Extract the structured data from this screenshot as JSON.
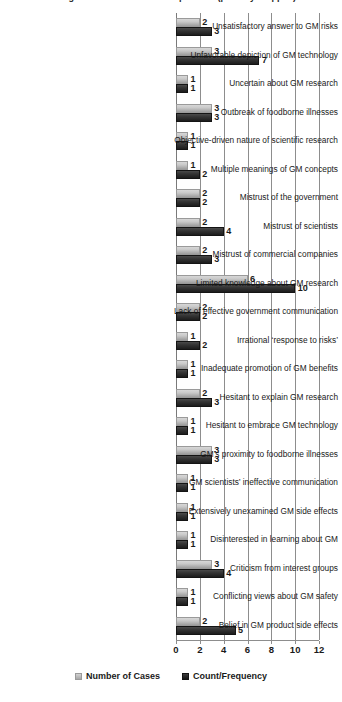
{
  "chart_data": {
    "type": "bar",
    "title": "Emergent themes and their frequencies (partially cropped)",
    "orientation": "horizontal",
    "xlabel": "",
    "ylabel": "",
    "xlim": [
      0,
      12
    ],
    "xticks": [
      0,
      2,
      4,
      6,
      8,
      10,
      12
    ],
    "grid": true,
    "legend_position": "bottom",
    "categories": [
      "Unsatisfactory answer to GM risks",
      "Unfavorable depiction of GM technology",
      "Uncertain about GM research",
      "Outbreak of foodborne illnesses",
      "Objective-driven nature of scientific research",
      "Multiple meanings of GM concepts",
      "Mistrust of the government",
      "Mistrust of scientists",
      "Mistrust of commercial companies",
      "Limited knowledge about GM research",
      "Lack of effective government communication",
      "Irrational ‘response to risks’",
      "Inadequate promotion of GM benefits",
      "Hesitant to explain GM research",
      "Hesitant to embrace GM technology",
      "GM’s proximity to foodborne illnesses",
      "GM scientists’ ineffective communication",
      "Extensively unexamined GM side effects",
      "Disinterested in learning about GM",
      "Criticism from interest groups",
      "Conflicting views about GM safety",
      "Belief in GM product side effects"
    ],
    "series": [
      {
        "name": "Number of Cases",
        "color": "#c9c9c9",
        "values": [
          2,
          3,
          1,
          3,
          1,
          1,
          2,
          2,
          2,
          6,
          2,
          1,
          1,
          2,
          1,
          3,
          1,
          1,
          1,
          3,
          1,
          2
        ]
      },
      {
        "name": "Count/Frequency",
        "color": "#1c1c1c",
        "values": [
          3,
          7,
          1,
          3,
          1,
          2,
          2,
          4,
          3,
          10,
          2,
          2,
          1,
          3,
          1,
          3,
          1,
          1,
          1,
          4,
          1,
          5
        ]
      }
    ]
  },
  "legend": {
    "items": [
      {
        "label": "Number of Cases",
        "swatch": "light"
      },
      {
        "label": "Count/Frequency",
        "swatch": "dark"
      }
    ]
  }
}
